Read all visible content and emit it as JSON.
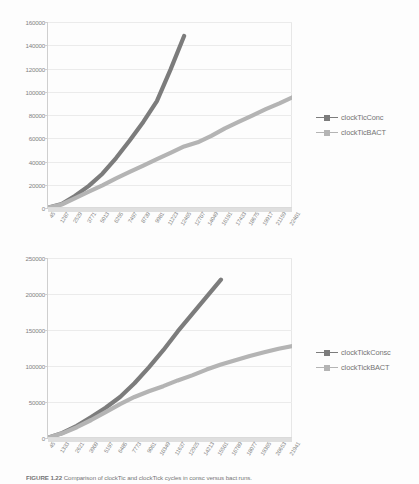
{
  "document": {
    "caption_label": "FIGURE 1.22",
    "caption_body": "Comparison of clockTic and clockTick cycles in consc versus bact runs."
  },
  "charts": [
    {
      "id": "top-chart",
      "name": "clock-tic-chart",
      "legend": [
        {
          "label": "clockTicConc",
          "color": "#3a3a3a",
          "key": "series-key-dark"
        },
        {
          "label": "clockTicBACT",
          "color": "#8f8f8f",
          "key": "series-key-gray"
        }
      ],
      "chart_data": {
        "type": "line",
        "title": "",
        "xlabel": "",
        "ylabel": "",
        "ylim": [
          0,
          160000
        ],
        "yticks": [
          0,
          20000,
          40000,
          60000,
          80000,
          100000,
          120000,
          140000,
          160000
        ],
        "grid": true,
        "legend_position": "right",
        "categories": [
          "45",
          "1287",
          "2529",
          "3771",
          "5013",
          "6255",
          "7497",
          "8739",
          "9981",
          "11223",
          "12465",
          "12707",
          "14049",
          "16191",
          "17433",
          "18675",
          "19917",
          "21159",
          "22401"
        ],
        "series": [
          {
            "name": "clockTicConc",
            "color": "#3a3a3a",
            "values": [
              200,
              3400,
              10500,
              19000,
              29500,
              43000,
              58000,
              74000,
              92000,
              119000,
              148000,
              null,
              null,
              null,
              null,
              null,
              null,
              null,
              null
            ]
          },
          {
            "name": "clockTicBACT",
            "color": "#8f8f8f",
            "values": [
              200,
              3000,
              8500,
              14000,
              19500,
              25500,
              31000,
              36500,
              42000,
              47500,
              53000,
              56500,
              62000,
              68500,
              74000,
              79500,
              85000,
              90000,
              95500
            ]
          }
        ]
      }
    },
    {
      "id": "bottom-chart",
      "name": "clock-tick-chart",
      "legend": [
        {
          "label": "clockTickConsc",
          "color": "#3a3a3a",
          "key": "series-key-dark"
        },
        {
          "label": "clockTickBACT",
          "color": "#8f8f8f",
          "key": "series-key-gray"
        }
      ],
      "chart_data": {
        "type": "line",
        "title": "",
        "xlabel": "",
        "ylabel": "",
        "ylim": [
          0,
          250000
        ],
        "yticks": [
          0,
          50000,
          100000,
          150000,
          200000,
          250000
        ],
        "grid": true,
        "legend_position": "right",
        "categories": [
          "45",
          "1333",
          "2621",
          "3909",
          "5197",
          "6485",
          "7773",
          "9061",
          "10349",
          "11637",
          "12925",
          "14213",
          "15501",
          "16789",
          "18077",
          "19365",
          "20653",
          "21941"
        ],
        "series": [
          {
            "name": "clockTickConsc",
            "color": "#3a3a3a",
            "values": [
              500,
              7000,
              17000,
              29000,
              42000,
              57000,
              76000,
              98000,
              122000,
              148000,
              172000,
              196000,
              220000,
              null,
              null,
              null,
              null,
              null
            ]
          },
          {
            "name": "clockTickBACT",
            "color": "#8f8f8f",
            "values": [
              500,
              6500,
              15000,
              25000,
              36000,
              47000,
              57000,
              65000,
              72000,
              80000,
              87000,
              95000,
              102000,
              108000,
              114000,
              119000,
              124000,
              128000
            ]
          }
        ]
      }
    }
  ]
}
